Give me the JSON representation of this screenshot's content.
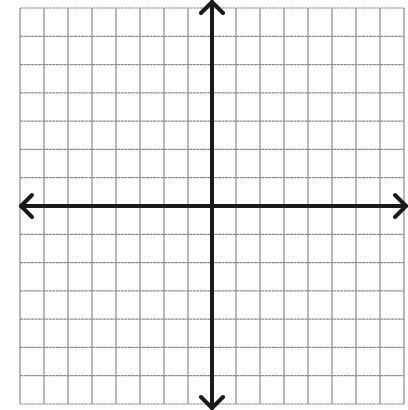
{
  "diagram": {
    "type": "coordinate-plane",
    "grid": {
      "columns": 16,
      "rows": 14,
      "columns_left_of_y_axis": 8,
      "columns_right_of_y_axis": 8,
      "rows_above_x_axis": 7,
      "rows_below_x_axis": 7,
      "line_color": "#8a8a8a",
      "background": "#ffffff"
    },
    "axes": {
      "color": "#1a1a1a",
      "x_axis": {
        "arrows": [
          "left",
          "right"
        ],
        "label": ""
      },
      "y_axis": {
        "arrows": [
          "up",
          "down"
        ],
        "label": ""
      }
    },
    "labels": [],
    "points": []
  }
}
